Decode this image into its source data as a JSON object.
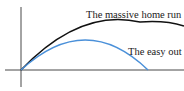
{
  "diagram": {
    "type": "trajectory-comparison",
    "curves": [
      {
        "name": "massive-home-run",
        "label": "The massive home run",
        "color": "#111111"
      },
      {
        "name": "easy-out",
        "label": "The easy out",
        "color": "#4a90d9"
      }
    ],
    "axes": {
      "color": "#333333"
    }
  }
}
